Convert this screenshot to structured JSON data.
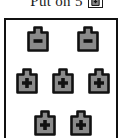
{
  "header": {
    "text": "Put on 5",
    "badge_icon": "plus-token-icon",
    "badge_sign": "plus"
  },
  "panel": {
    "name": "token-board",
    "border_color": "#111111",
    "background_color": "#ffffff",
    "token_fill_color": "#8a8a8a",
    "token_outline_color": "#111111",
    "token_sign_color": "#111111",
    "rows": [
      {
        "row_label": "row-1",
        "tokens": [
          {
            "sign": "minus",
            "icon": "minus-token-icon"
          },
          {
            "sign": "minus",
            "icon": "minus-token-icon"
          }
        ]
      },
      {
        "row_label": "row-2",
        "tokens": [
          {
            "sign": "plus",
            "icon": "plus-token-icon"
          },
          {
            "sign": "plus",
            "icon": "plus-token-icon"
          },
          {
            "sign": "plus",
            "icon": "plus-token-icon"
          }
        ]
      },
      {
        "row_label": "row-3",
        "tokens": [
          {
            "sign": "plus",
            "icon": "plus-token-icon"
          },
          {
            "sign": "plus",
            "icon": "plus-token-icon"
          }
        ]
      }
    ],
    "minus_count": 2,
    "plus_count": 5,
    "total_count": 7
  }
}
